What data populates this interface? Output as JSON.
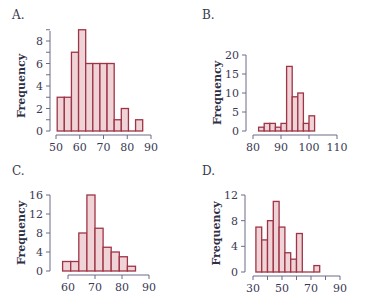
{
  "colors": {
    "bar_fill": "#efd3d7",
    "bar_stroke": "#9e3446",
    "axis": "#6b6b88",
    "text": "#3a3a55"
  },
  "chart_data": [
    {
      "panel_label": "A.",
      "type": "bar",
      "xlabel": "",
      "ylabel": "Frequency",
      "bin_start": 50.5,
      "bin_width": 3,
      "values": [
        3,
        3,
        7,
        9,
        6,
        6,
        6,
        6,
        1,
        2,
        0,
        1
      ],
      "xticks": [
        50,
        60,
        70,
        80,
        90
      ],
      "yticks": [
        0,
        2,
        4,
        6,
        8
      ],
      "yticks_labeled": [
        0,
        2,
        4,
        6,
        8
      ],
      "xlim": [
        50,
        90
      ],
      "ylim": [
        0,
        9
      ],
      "grid": false,
      "box": {
        "x0": 56,
        "x1": 151,
        "y0": 131,
        "ytop": 30,
        "axis_x": 50
      }
    },
    {
      "panel_label": "B.",
      "type": "bar",
      "xlabel": "",
      "ylabel": "Frequency",
      "bin_start": 82,
      "bin_width": 2,
      "values": [
        1,
        2,
        2,
        1,
        2,
        17,
        9,
        10,
        2,
        4
      ],
      "xticks": [
        80,
        90,
        100,
        110
      ],
      "yticks": [
        0,
        5,
        10,
        15,
        20
      ],
      "xlim": [
        80,
        110
      ],
      "ylim": [
        0,
        20
      ],
      "grid": false,
      "box": {
        "x0": 253,
        "x1": 337,
        "y0": 131,
        "ytop": 55,
        "axis_x": 246
      }
    },
    {
      "panel_label": "C.",
      "type": "bar",
      "xlabel": "",
      "ylabel": "Frequency",
      "bin_start": 58,
      "bin_width": 3,
      "values": [
        2,
        2,
        8,
        16,
        9,
        5,
        4,
        3,
        1
      ],
      "xticks": [
        60,
        70,
        80,
        90
      ],
      "yticks": [
        0,
        4,
        8,
        12,
        16
      ],
      "xlim": [
        60,
        90
      ],
      "ylim": [
        0,
        16
      ],
      "grid": false,
      "box": {
        "x0": 68,
        "x1": 149,
        "y0": 271,
        "ytop": 195,
        "axis_x": 50
      }
    },
    {
      "panel_label": "D.",
      "type": "bar",
      "xlabel": "",
      "ylabel": "Frequency",
      "bin_start": 32,
      "bin_width": 4,
      "values": [
        7,
        5,
        8,
        11,
        7,
        3,
        2,
        6,
        0,
        0,
        1
      ],
      "xticks": [
        30,
        40,
        50,
        60,
        70,
        80,
        90
      ],
      "xtick_labels": [
        "30",
        "",
        "50",
        "",
        "70",
        "",
        "90"
      ],
      "yticks": [
        0,
        4,
        8,
        12
      ],
      "xlim": [
        30,
        90
      ],
      "ylim": [
        0,
        12
      ],
      "grid": false,
      "box": {
        "x0": 253,
        "x1": 340,
        "y0": 272,
        "ytop": 195,
        "axis_x": 245
      }
    }
  ]
}
